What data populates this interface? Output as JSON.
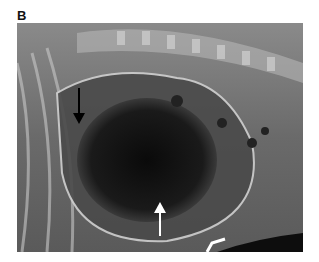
{
  "figure": {
    "panel_label": "B",
    "image": {
      "type": "radiograph",
      "description": "Lateral thoracic/abdominal radiograph showing a large gas-filled dilated structure with arrows",
      "annotations": [
        {
          "type": "arrow",
          "direction": "down",
          "color": "#000000"
        },
        {
          "type": "arrow",
          "direction": "up",
          "color": "#ffffff"
        },
        {
          "type": "marker",
          "shape": "bracket",
          "color": "#ffffff"
        }
      ]
    }
  }
}
